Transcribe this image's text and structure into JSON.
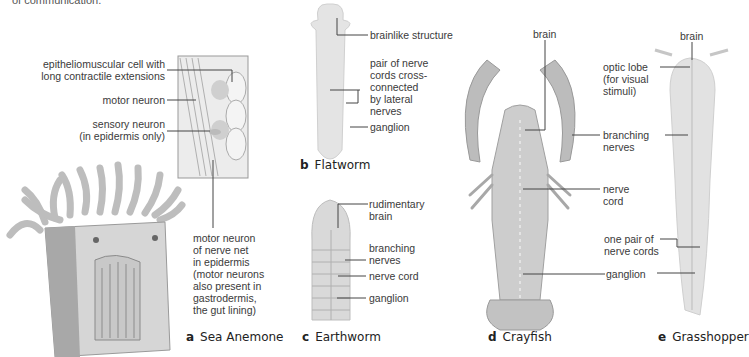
{
  "top_fragment": "of communication.",
  "panels": {
    "a": {
      "letter": "a",
      "title": "Sea Anemone",
      "labels": [
        "epitheliomuscular cell with\nlong contractile extensions",
        "motor neuron",
        "sensory neuron\n(in epidermis only)",
        "motor neuron\nof nerve net\nin epidermis\n(motor neurons\nalso present in\ngastrodermis,\nthe gut lining)"
      ]
    },
    "b": {
      "letter": "b",
      "title": "Flatworm",
      "labels": [
        "brainlike structure",
        "pair of nerve\ncords cross-\nconnected\nby lateral\nnerves",
        "ganglion"
      ]
    },
    "c": {
      "letter": "c",
      "title": "Earthworm",
      "labels": [
        "rudimentary\nbrain",
        "branching\nnerves",
        "nerve cord",
        "ganglion"
      ]
    },
    "d": {
      "letter": "d",
      "title": "Crayfish",
      "labels": [
        "brain",
        "branching\nnerves",
        "nerve\ncord",
        "one pair of\nnerve cords",
        "ganglion"
      ]
    },
    "e": {
      "letter": "e",
      "title": "Grasshopper",
      "labels": [
        "brain",
        "optic lobe\n(for visual\nstimuli)"
      ]
    }
  },
  "caption_fragment": "Figure 34.1"
}
